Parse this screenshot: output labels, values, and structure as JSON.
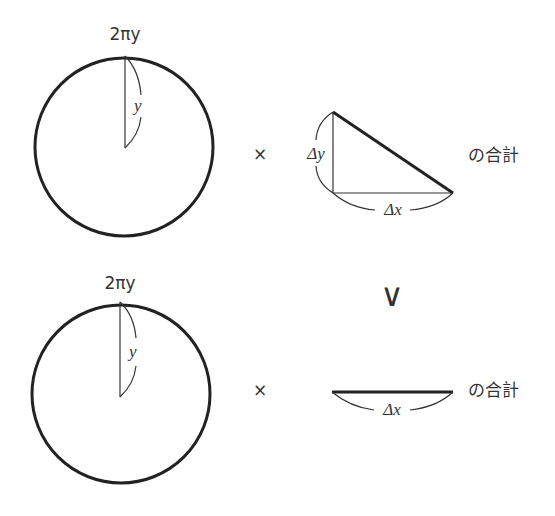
{
  "top_row": {
    "circle_label": "2πy",
    "radius_label": "y",
    "times_symbol": "×",
    "dy_label": "Δy",
    "dx_label": "Δx",
    "sum_label": "の合計"
  },
  "comparison": {
    "symbol": "∨"
  },
  "bottom_row": {
    "circle_label": "2πy",
    "radius_label": "y",
    "times_symbol": "×",
    "dx_label": "Δx",
    "sum_label": "の合計"
  },
  "colors": {
    "stroke": "#222222",
    "text": "#333333",
    "background": "#ffffff"
  }
}
